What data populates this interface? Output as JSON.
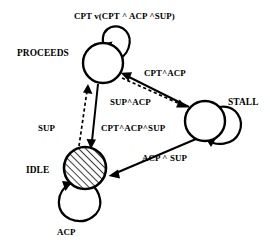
{
  "diagram": {
    "type": "state-transition-diagram",
    "background_color": "#ffffff",
    "stroke_color": "#000000",
    "states": [
      {
        "id": "proceeds",
        "label": "PROCEEDS",
        "shape": "circle",
        "fill": "white",
        "cx": 103,
        "cy": 63,
        "r": 20
      },
      {
        "id": "stall",
        "label": "STALL",
        "shape": "circle",
        "fill": "white",
        "cx": 205,
        "cy": 121,
        "r": 20
      },
      {
        "id": "idle",
        "label": "IDLE",
        "shape": "circle",
        "fill": "hatched",
        "cx": 85,
        "cy": 168,
        "r": 21
      }
    ],
    "transitions": [
      {
        "id": "proceeds-self-loop",
        "from": "proceeds",
        "to": "proceeds",
        "label": "CPT v(CPT ^ ACP ^SUP)",
        "style": "solid",
        "kind": "self-loop"
      },
      {
        "id": "stall-to-proceeds",
        "from": "stall",
        "to": "proceeds",
        "label": "CPT^ACP",
        "style": "solid",
        "kind": "edge"
      },
      {
        "id": "proceeds-to-stall",
        "from": "proceeds",
        "to": "stall",
        "label": "SUP^ACP",
        "style": "dashed",
        "kind": "edge"
      },
      {
        "id": "idle-to-proceeds",
        "from": "idle",
        "to": "proceeds",
        "label": "SUP",
        "style": "dashed",
        "kind": "edge"
      },
      {
        "id": "proceeds-to-idle",
        "from": "proceeds",
        "to": "idle",
        "label": "CPT^ACP^SUP",
        "style": "solid",
        "kind": "edge"
      },
      {
        "id": "stall-to-idle",
        "from": "stall",
        "to": "idle",
        "label": "ACP ^ SUP",
        "style": "solid",
        "kind": "edge"
      },
      {
        "id": "stall-self-loop",
        "from": "stall",
        "to": "stall",
        "label": "",
        "style": "solid",
        "kind": "self-loop"
      },
      {
        "id": "idle-self-loop",
        "from": "idle",
        "to": "idle",
        "label": "ACP",
        "style": "solid",
        "kind": "self-loop"
      }
    ],
    "labels": {
      "proceeds_state": "PROCEEDS",
      "stall_state": "STALL",
      "idle_state": "IDLE",
      "proceeds_loop": "CPT v(CPT ^ ACP ^SUP)",
      "stall_to_proceeds": "CPT^ACP",
      "proceeds_to_stall": "SUP^ACP",
      "idle_to_proceeds": "SUP",
      "proceeds_to_idle": "CPT^ACP^SUP",
      "stall_to_idle": "ACP ^ SUP",
      "idle_loop": "ACP"
    }
  }
}
